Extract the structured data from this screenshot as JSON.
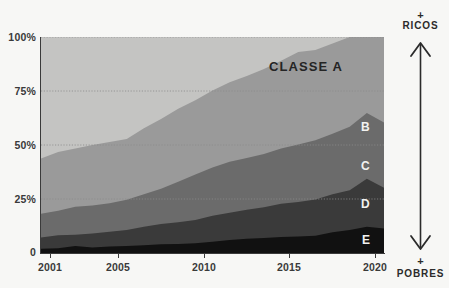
{
  "chart_data": {
    "type": "area",
    "title": "",
    "subtitle": "",
    "xlabel": "",
    "ylabel": "",
    "stacked": true,
    "stack_normalized": true,
    "grid": true,
    "legend_position": "inside-right",
    "xlim": [
      2001,
      2021
    ],
    "ylim": [
      0,
      100
    ],
    "ytick_labels": [
      "100%",
      "75%",
      "50%",
      "25%",
      "0"
    ],
    "ytick_values": [
      100,
      75,
      50,
      25,
      0
    ],
    "xtick_labels": [
      "2001",
      "2005",
      "2010",
      "2015",
      "2020"
    ],
    "xtick_values": [
      2001,
      2005,
      2010,
      2015,
      2020
    ],
    "x": [
      2001,
      2002,
      2003,
      2004,
      2005,
      2006,
      2007,
      2008,
      2009,
      2010,
      2011,
      2012,
      2013,
      2014,
      2015,
      2016,
      2017,
      2018,
      2019,
      2020,
      2021
    ],
    "series": [
      {
        "name": "E",
        "label": "E",
        "color": "#111111",
        "label_color": "#f2f2f0",
        "values": [
          2.0,
          2.2,
          3.2,
          2.6,
          3.0,
          3.2,
          3.6,
          4.0,
          4.2,
          4.5,
          5.2,
          6.0,
          6.6,
          7.0,
          7.4,
          7.6,
          8.0,
          9.6,
          10.6,
          12.2,
          11.4
        ]
      },
      {
        "name": "D",
        "label": "D",
        "color": "#3a3a3a",
        "label_color": "#f2f2f0",
        "values": [
          5.2,
          6.0,
          5.2,
          6.4,
          6.8,
          7.4,
          8.6,
          9.4,
          10.0,
          10.8,
          12.0,
          12.6,
          13.4,
          14.2,
          15.4,
          16.0,
          16.8,
          17.6,
          18.4,
          22.2,
          18.8
        ]
      },
      {
        "name": "C",
        "label": "C",
        "color": "#6b6b6b",
        "label_color": "#f2f2f0",
        "values": [
          11.0,
          11.4,
          13.0,
          13.0,
          13.2,
          14.0,
          15.0,
          16.4,
          18.8,
          21.0,
          22.4,
          23.6,
          24.0,
          24.6,
          25.6,
          26.6,
          27.4,
          28.0,
          29.4,
          30.4,
          30.2
        ]
      },
      {
        "name": "B",
        "label": "B",
        "color": "#9a9a9a",
        "label_color": "#f2f2f0",
        "values": [
          25.6,
          27.2,
          27.0,
          28.0,
          28.4,
          28.2,
          30.6,
          32.2,
          33.8,
          34.4,
          35.6,
          36.8,
          38.0,
          39.4,
          40.6,
          42.8,
          41.8,
          41.8,
          43.6,
          44.8,
          43.8
        ]
      },
      {
        "name": "A",
        "label": "CLASSE A",
        "color": "#c4c4c2",
        "label_color": "#242424",
        "values": [
          56.2,
          53.2,
          51.6,
          50.0,
          48.6,
          47.2,
          42.2,
          38.0,
          33.2,
          29.3,
          24.8,
          21.0,
          18.0,
          14.8,
          11.0,
          7.0,
          6.0,
          3.0,
          0.0,
          0.0,
          0.0
        ]
      }
    ],
    "cumulative_tops": {
      "E": [
        2.0,
        2.2,
        3.2,
        2.6,
        3.0,
        3.2,
        3.6,
        4.0,
        4.2,
        4.5,
        5.2,
        6.0,
        6.6,
        7.0,
        7.4,
        7.6,
        8.0,
        9.6,
        10.6,
        12.2,
        11.4
      ],
      "D": [
        7.2,
        8.2,
        8.4,
        9.0,
        9.8,
        10.6,
        12.2,
        13.4,
        14.2,
        15.3,
        17.2,
        18.6,
        20.0,
        21.2,
        22.8,
        23.6,
        24.8,
        27.2,
        29.0,
        34.4,
        30.2
      ],
      "C": [
        18.2,
        19.6,
        21.4,
        22.0,
        23.0,
        24.6,
        27.2,
        29.8,
        33.0,
        36.3,
        39.6,
        42.2,
        44.0,
        45.8,
        48.4,
        50.2,
        52.2,
        55.2,
        58.4,
        64.8,
        60.4
      ],
      "B": [
        43.8,
        46.8,
        48.4,
        50.0,
        51.4,
        52.8,
        57.8,
        62.0,
        66.8,
        70.7,
        75.2,
        79.0,
        82.0,
        85.2,
        89.0,
        93.0,
        94.0,
        97.0,
        100.0,
        100.0,
        100.0
      ],
      "A": [
        100,
        100,
        100,
        100,
        100,
        100,
        100,
        100,
        100,
        100,
        100,
        100,
        100,
        100,
        100,
        100,
        100,
        100,
        100,
        100,
        100
      ]
    }
  },
  "annotations": {
    "top_plus": "+",
    "top_label": "RICOS",
    "bottom_plus": "+",
    "bottom_label": "POBRES",
    "arrow_name": "double-headed-vertical-arrow"
  },
  "colors": {
    "background": "#f7f7f5",
    "axis": "#3a3a3a",
    "grid": "#8c8c8c",
    "text": "#2b2b2b"
  }
}
